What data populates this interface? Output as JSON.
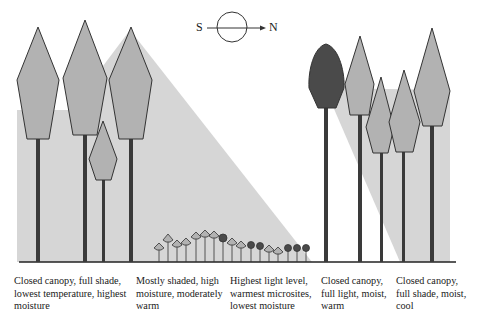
{
  "compass": {
    "south_label": "S",
    "north_label": "N",
    "icon": "sun-compass-icon"
  },
  "colors": {
    "shade": "#d6d6d6",
    "crown_light": "#b2b2b2",
    "crown_dark": "#4a4a4a",
    "trunk": "#3a3a3a",
    "outline": "#333333",
    "ground": "#222222"
  },
  "zones": [
    {
      "id": "closed-canopy-full-shade-cold",
      "caption": "Closed canopy, full shade,\nlowest temperature, highest\nmoisture"
    },
    {
      "id": "mostly-shaded",
      "caption": "Mostly shaded, high\nmoisture, moderately\nwarm"
    },
    {
      "id": "gap-center",
      "caption": "Highest light level,\nwarmest microsites,\nlowest moisture"
    },
    {
      "id": "closed-canopy-full-light",
      "caption": "Closed canopy,\nfull light, moist,\nwarm"
    },
    {
      "id": "closed-canopy-full-shade-cool",
      "caption": "Closed canopy,\nfull shade, moist,\ncool"
    }
  ]
}
